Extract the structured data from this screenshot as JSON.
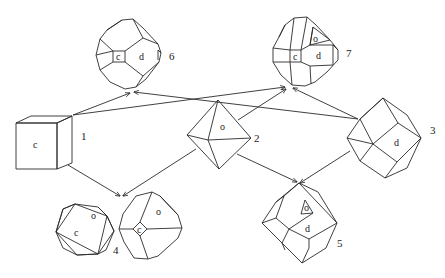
{
  "figure": {
    "type": "crystal-form-relationship-diagram",
    "colors": {
      "line": "#2a2a2a",
      "background": "#ffffff",
      "text": "#222222"
    }
  },
  "crystals": [
    {
      "id": 1,
      "number_label": "1",
      "form": "cube",
      "face_labels": [
        "c"
      ]
    },
    {
      "id": 2,
      "number_label": "2",
      "form": "octahedron",
      "face_labels": [
        "o"
      ]
    },
    {
      "id": 3,
      "number_label": "3",
      "form": "rhombic-dodecahedron",
      "face_labels": [
        "d"
      ]
    },
    {
      "id": 4,
      "number_label": "4",
      "form": "cube-octahedron-combination",
      "face_labels": [
        "c",
        "o",
        "c",
        "o"
      ]
    },
    {
      "id": 5,
      "number_label": "5",
      "form": "octahedron-dodecahedron-combination",
      "face_labels": [
        "o",
        "d"
      ]
    },
    {
      "id": 6,
      "number_label": "6",
      "form": "cube-dodecahedron-combination",
      "face_labels": [
        "c",
        "d"
      ]
    },
    {
      "id": 7,
      "number_label": "7",
      "form": "cube-octahedron-dodecahedron-combination",
      "face_labels": [
        "o",
        "c",
        "d"
      ]
    }
  ],
  "arrows": [
    {
      "from": "1",
      "to": "6"
    },
    {
      "from": "1",
      "to": "7"
    },
    {
      "from": "2",
      "to": "7"
    },
    {
      "from": "3",
      "to": "6"
    },
    {
      "from": "3",
      "to": "7"
    },
    {
      "from": "1",
      "to": "4"
    },
    {
      "from": "2",
      "to": "4"
    },
    {
      "from": "2",
      "to": "5"
    },
    {
      "from": "3",
      "to": "5"
    }
  ],
  "labels": {
    "c1_face": "c",
    "n1": "1",
    "o2_face": "o",
    "n2": "2",
    "d3_face": "d",
    "n3": "3",
    "c4a_face": "c",
    "o4a_face": "o",
    "c4b_face": "c",
    "o4b_face": "o",
    "n4": "4",
    "o5_face": "o",
    "d5_face": "d",
    "n5": "5",
    "c6_face": "c",
    "d6_face": "d",
    "n6": "6",
    "o7_face": "o",
    "c7_face": "c",
    "d7_face": "d",
    "n7": "7"
  }
}
